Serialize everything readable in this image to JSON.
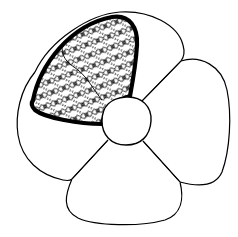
{
  "image": {
    "description": "Line drawing of a four-petal flower with a round center; the upper-left petal is outlined in a heavy stroke and filled with a lace/net pattern",
    "petal_count": 4,
    "highlighted_petal": "upper-left",
    "highlight_fill": "lace-mesh"
  },
  "colors": {
    "background": "#ffffff",
    "line": "#000000"
  }
}
